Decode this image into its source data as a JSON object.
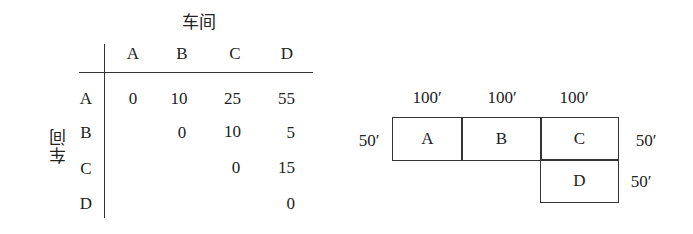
{
  "matrix": {
    "col_title": "车间",
    "row_title": "车间",
    "columns": [
      "A",
      "B",
      "C",
      "D"
    ],
    "rows": [
      {
        "label": "A",
        "values": [
          "0",
          "10",
          "25",
          "55"
        ]
      },
      {
        "label": "B",
        "values": [
          "",
          "0",
          "10",
          "5"
        ]
      },
      {
        "label": "C",
        "values": [
          "",
          "",
          "0",
          "15"
        ]
      },
      {
        "label": "D",
        "values": [
          "",
          "",
          "",
          "0"
        ]
      }
    ]
  },
  "layout": {
    "top_dims": [
      "100′",
      "100′",
      "100′"
    ],
    "left_dim": "50′",
    "right_dims": [
      "50′",
      "50′"
    ],
    "boxes": [
      "A",
      "B",
      "C",
      "D"
    ]
  }
}
